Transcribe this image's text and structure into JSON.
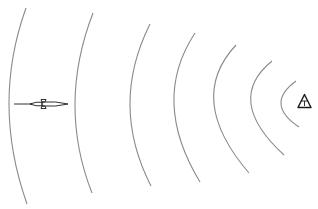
{
  "diagram": {
    "colors": {
      "arc": "#8a8a8a",
      "icon": "#1a1a1a",
      "background": "#ffffff"
    },
    "arcs": [
      {
        "top": [
          26,
          8
        ],
        "apex": [
          9,
          105
        ],
        "bottom": [
          27,
          204
        ]
      },
      {
        "top": [
          93,
          13
        ],
        "apex": [
          75,
          104
        ],
        "bottom": [
          92,
          193
        ]
      },
      {
        "top": [
          150,
          24
        ],
        "apex": [
          130,
          105
        ],
        "bottom": [
          151,
          186
        ]
      },
      {
        "top": [
          195,
          33
        ],
        "apex": [
          174,
          104
        ],
        "bottom": [
          200,
          182
        ]
      },
      {
        "top": [
          236,
          45
        ],
        "apex": [
          214,
          104
        ],
        "bottom": [
          249,
          173
        ]
      },
      {
        "top": [
          272,
          61
        ],
        "apex": [
          251,
          104
        ],
        "bottom": [
          284,
          155
        ]
      },
      {
        "top": [
          296,
          81
        ],
        "apex": [
          281,
          104
        ],
        "bottom": [
          299,
          127
        ]
      }
    ],
    "icons": [
      {
        "name": "missile-icon",
        "x": 14,
        "y": 103
      },
      {
        "name": "beacon-triangle-icon",
        "x": 304,
        "y": 102
      }
    ]
  }
}
